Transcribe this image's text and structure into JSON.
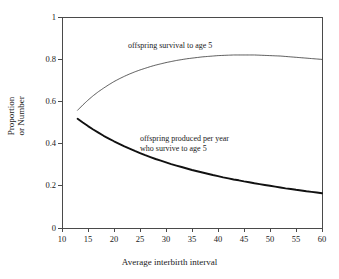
{
  "chart_data": {
    "type": "line",
    "title": "",
    "subtitle": "",
    "xlabel": "Average interbirth interval",
    "ylabel": "Proportion or Number",
    "ylabel_lines": [
      "Proportion",
      "or Number"
    ],
    "xlim": [
      10,
      60
    ],
    "ylim": [
      0,
      1
    ],
    "xticks": [
      10,
      15,
      20,
      25,
      30,
      35,
      40,
      45,
      50,
      55,
      60
    ],
    "xticklabels": [
      "10",
      "15",
      "20",
      "25",
      "30",
      "35",
      "40",
      "45",
      "50",
      "55",
      "60"
    ],
    "yticks": [
      0,
      0.2,
      0.4,
      0.6,
      0.8,
      1
    ],
    "yticklabels": [
      "0",
      "0.2",
      "0.4",
      "0.6",
      "0.8",
      "1"
    ],
    "grid": false,
    "legend": "none",
    "frame": "box",
    "annotations": [
      {
        "name": "offspring-survival-annotation",
        "text": "offspring survival to age 5",
        "lines": [
          "offspring survival to age 5"
        ],
        "x": 23.5,
        "y": 0.895
      },
      {
        "name": "offspring-produced-annotation",
        "text": "offspring produced per year who survive to age 5",
        "lines": [
          "offspring produced per year",
          "who survive to age 5"
        ],
        "x": 26.0,
        "y": 0.455
      }
    ],
    "series": [
      {
        "name": "offspring survival to age 5",
        "label": "offspring survival to age 5",
        "style": "dotted",
        "linewidth": 0.8,
        "color": "#3a3a3a",
        "x": [
          13,
          14,
          15,
          16,
          17,
          18,
          19,
          20,
          21,
          22,
          23,
          24,
          25,
          26,
          27,
          28,
          29,
          30,
          31,
          32,
          33,
          34,
          35,
          36,
          37,
          38,
          39,
          40,
          41,
          42,
          43,
          44,
          45,
          46,
          47,
          48,
          49,
          50,
          51,
          52,
          53,
          54,
          55,
          56,
          57,
          58,
          59,
          60
        ],
        "y": [
          0.558,
          0.583,
          0.606,
          0.627,
          0.646,
          0.663,
          0.679,
          0.694,
          0.707,
          0.719,
          0.73,
          0.74,
          0.749,
          0.757,
          0.765,
          0.772,
          0.778,
          0.784,
          0.789,
          0.794,
          0.798,
          0.802,
          0.805,
          0.808,
          0.811,
          0.813,
          0.815,
          0.817,
          0.818,
          0.819,
          0.82,
          0.82,
          0.82,
          0.82,
          0.82,
          0.819,
          0.818,
          0.817,
          0.816,
          0.815,
          0.813,
          0.811,
          0.809,
          0.807,
          0.805,
          0.803,
          0.801,
          0.799
        ]
      },
      {
        "name": "offspring produced per year who survive to age 5",
        "label": "offspring produced per year who survive to age 5",
        "style": "solid",
        "linewidth": 1.9,
        "color": "#111111",
        "x": [
          13,
          14,
          15,
          16,
          17,
          18,
          19,
          20,
          21,
          22,
          23,
          24,
          25,
          26,
          27,
          28,
          29,
          30,
          31,
          32,
          33,
          34,
          35,
          36,
          37,
          38,
          39,
          40,
          41,
          42,
          43,
          44,
          45,
          46,
          47,
          48,
          49,
          50,
          51,
          52,
          53,
          54,
          55,
          56,
          57,
          58,
          59,
          60
        ],
        "y": [
          0.518,
          0.5,
          0.483,
          0.467,
          0.452,
          0.437,
          0.424,
          0.411,
          0.399,
          0.387,
          0.376,
          0.365,
          0.355,
          0.345,
          0.336,
          0.327,
          0.319,
          0.311,
          0.303,
          0.296,
          0.289,
          0.282,
          0.275,
          0.269,
          0.263,
          0.257,
          0.251,
          0.246,
          0.24,
          0.235,
          0.23,
          0.226,
          0.221,
          0.217,
          0.212,
          0.208,
          0.204,
          0.2,
          0.196,
          0.192,
          0.188,
          0.185,
          0.181,
          0.178,
          0.174,
          0.171,
          0.168,
          0.165
        ]
      }
    ]
  },
  "figure": {
    "background": "#ffffff",
    "axis_color": "#4a4a4a"
  }
}
